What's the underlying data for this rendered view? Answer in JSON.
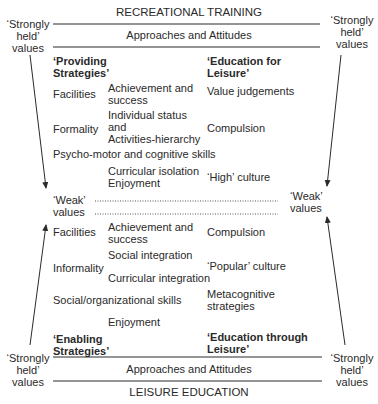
{
  "diagram": {
    "top_title": "RECREATIONAL TRAINING",
    "bottom_title": "LEISURE EDUCATION",
    "band_label_top": "Approaches and Attitudes",
    "band_label_bottom": "Approaches and Attitudes",
    "side_labels": {
      "strong_top_left": "‘Strongly\nheld’\nvalues",
      "strong_top_right": "‘Strongly\nheld’\nvalues",
      "strong_bottom_left": "‘Strongly\nheld’\nvalues",
      "strong_bottom_right": "‘Strongly\nheld’\nvalues",
      "weak_left": "‘Weak’\nvalues",
      "weak_right": "‘Weak’\nvalues"
    },
    "upper_section": {
      "heading_left": "‘Providing\nStrategies’",
      "heading_right": "‘Education for\nLeisure’",
      "items": {
        "facilities": "Facilities",
        "achievement": "Achievement and\nsuccess",
        "value_judgements": "Value judgements",
        "formality": "Formality",
        "individual_status": "Individual status\n      and\nActivities-hierarchy",
        "compulsion": "Compulsion",
        "psycho_motor": "Psycho-motor and cognitive skills",
        "curricular_isolation": "Curricular isolation\nEnjoyment",
        "high_culture": "‘High’ culture"
      }
    },
    "lower_section": {
      "heading_left": "‘Enabling\nStrategies’",
      "heading_right": "‘Education through\nLeisure’",
      "items": {
        "facilities": "Facilities",
        "achievement": "Achievement and\nsuccess",
        "compulsion": "Compulsion",
        "social_integration": "Social integration",
        "informality": "Informality",
        "popular_culture": "‘Popular’ culture",
        "curricular_integration": "Curricular integration",
        "social_org_skills": "Social/organizational skills",
        "metacognitive": "Metacognitive\nstrategies",
        "enjoyment": "Enjoyment"
      }
    },
    "colors": {
      "ink": "#2a2a2a",
      "background": "#ffffff"
    }
  }
}
